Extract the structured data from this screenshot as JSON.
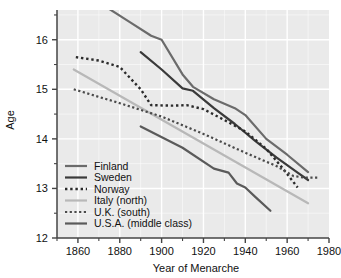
{
  "chart_data": {
    "type": "line",
    "title": "",
    "xlabel": "Year of Menarche",
    "ylabel": "Age",
    "xlim": [
      1850,
      1980
    ],
    "ylim": [
      12,
      16.6
    ],
    "xticks": [
      1860,
      1880,
      1900,
      1920,
      1940,
      1960,
      1980
    ],
    "xticklabels": [
      "1860",
      "1880",
      "1900",
      "1920",
      "1940",
      "1960",
      "1980"
    ],
    "xminorticks": [
      1850,
      1870,
      1890,
      1910,
      1930,
      1950,
      1970
    ],
    "yticks": [
      12,
      13,
      14,
      15,
      16
    ],
    "yticklabels": [
      "12",
      "13",
      "14",
      "15",
      "16"
    ],
    "yminorticks": [
      12.5,
      13.5,
      14.5,
      15.5,
      16.5
    ],
    "grid": true,
    "grid_color": "#ffffff",
    "plot_bg": "#eaeaea",
    "legend_position": "lower-left",
    "series": [
      {
        "name": "Finland",
        "legend_label": "Finland",
        "color": "#6b6b6b",
        "style": "solid",
        "width": 2.2,
        "x": [
          1875,
          1885,
          1895,
          1900,
          1910,
          1915,
          1925,
          1935,
          1940,
          1950,
          1960,
          1970
        ],
        "values": [
          16.62,
          16.35,
          16.08,
          16.0,
          15.3,
          15.05,
          14.8,
          14.62,
          14.48,
          14.0,
          13.68,
          13.33
        ]
      },
      {
        "name": "Sweden",
        "legend_label": "Sweden",
        "color": "#3a3a3a",
        "style": "solid",
        "width": 2.2,
        "x": [
          1890,
          1900,
          1910,
          1915,
          1925,
          1935,
          1945,
          1955,
          1965,
          1970
        ],
        "values": [
          15.75,
          15.4,
          15.02,
          14.97,
          14.62,
          14.3,
          13.95,
          13.62,
          13.32,
          13.17
        ]
      },
      {
        "name": "Norway",
        "legend_label": "Norway",
        "color": "#2b2b2b",
        "style": "dotted",
        "width": 2.4,
        "x": [
          1859,
          1870,
          1880,
          1890,
          1895,
          1905,
          1912,
          1920,
          1930,
          1940,
          1950,
          1958,
          1965
        ],
        "values": [
          15.65,
          15.58,
          15.45,
          15.0,
          14.68,
          14.67,
          14.68,
          14.6,
          14.38,
          14.15,
          13.8,
          13.4,
          13.02
        ]
      },
      {
        "name": "Italy (north)",
        "legend_label": "Italy (north)",
        "color": "#b8b8b8",
        "style": "solid",
        "width": 2.2,
        "x": [
          1858,
          1970
        ],
        "values": [
          15.4,
          12.7
        ]
      },
      {
        "name": "U.K. (south)",
        "legend_label": "U.K. (south)",
        "color": "#4a4a4a",
        "style": "dotted",
        "width": 2.2,
        "x": [
          1858,
          1880,
          1900,
          1920,
          1940,
          1955,
          1963,
          1968,
          1975
        ],
        "values": [
          15.0,
          14.72,
          14.45,
          14.1,
          13.72,
          13.45,
          13.25,
          13.22,
          13.22
        ]
      },
      {
        "name": "U.S.A. (middle class)",
        "legend_label": "U.S.A. (middle class)",
        "color": "#5a5a5a",
        "style": "solid",
        "width": 2.2,
        "x": [
          1890,
          1910,
          1925,
          1932,
          1936,
          1940,
          1945,
          1952
        ],
        "values": [
          14.25,
          13.82,
          13.4,
          13.32,
          13.1,
          13.02,
          12.82,
          12.55
        ]
      }
    ]
  }
}
